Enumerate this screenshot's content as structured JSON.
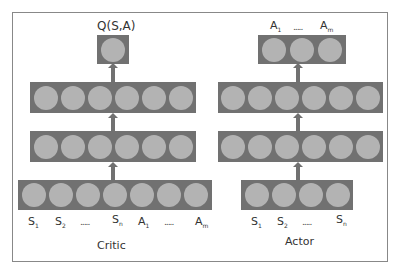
{
  "critic": {
    "title": "Critic",
    "output_label": "Q(S,A)",
    "input_labels": [
      {
        "base": "S",
        "sub": "1"
      },
      {
        "base": "S",
        "sub": "2"
      },
      {
        "base": "",
        "sub": "",
        "dots": "....."
      },
      {
        "base": "S",
        "sub": "n"
      },
      {
        "base": "A",
        "sub": "1"
      },
      {
        "base": "",
        "sub": "",
        "dots": "....."
      },
      {
        "base": "A",
        "sub": "m"
      }
    ],
    "layers": [
      {
        "name": "output",
        "nodes": 1
      },
      {
        "name": "hidden-1",
        "nodes": 6
      },
      {
        "name": "hidden-2",
        "nodes": 6
      },
      {
        "name": "input",
        "nodes": 7
      }
    ]
  },
  "actor": {
    "title": "Actor",
    "output_labels": [
      {
        "base": "A",
        "sub": "1"
      },
      {
        "base": "",
        "sub": "",
        "dots": "....."
      },
      {
        "base": "A",
        "sub": "m"
      }
    ],
    "input_labels": [
      {
        "base": "S",
        "sub": "1"
      },
      {
        "base": "S",
        "sub": "2"
      },
      {
        "base": "",
        "sub": "",
        "dots": "....."
      },
      {
        "base": "S",
        "sub": "n"
      }
    ],
    "layers": [
      {
        "name": "output",
        "nodes": 3
      },
      {
        "name": "hidden-1",
        "nodes": 6
      },
      {
        "name": "hidden-2",
        "nodes": 6
      },
      {
        "name": "input",
        "nodes": 4
      }
    ]
  },
  "colors": {
    "layer": "#717171",
    "node": "#b3b3b3",
    "border": "#888888"
  }
}
